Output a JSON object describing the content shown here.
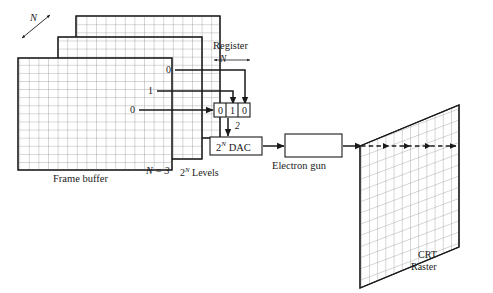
{
  "figure": {
    "background_color": "#ffffff",
    "line_color": "#1a1a1a",
    "grid_color": "#8c8c8c"
  },
  "frame_buffer": {
    "label": "Frame buffer",
    "depth_label": "N",
    "planes_label": "N = 3",
    "levels_label": "2",
    "levels_sup": "N",
    "levels_suffix": " Levels",
    "plane_count": 3,
    "grid_cols": 16,
    "grid_rows": 16,
    "pixel_bits": [
      {
        "plane": 1,
        "value": "0"
      },
      {
        "plane": 2,
        "value": "1"
      },
      {
        "plane": 3,
        "value": "0"
      }
    ]
  },
  "register": {
    "label": "Register",
    "width_label": "N",
    "left_arrow": "←",
    "right_arrow": "→",
    "cells": [
      "0",
      "1",
      "0"
    ]
  },
  "dac": {
    "label_base": "2",
    "label_sup": "N",
    "label_suffix": " DAC",
    "input_label": "2"
  },
  "electron_gun": {
    "label": "Electron gun"
  },
  "crt": {
    "label_line1": "CRT",
    "label_line2": "Raster",
    "grid_cols": 13,
    "grid_rows": 14,
    "scan_line": "dashed-beam"
  }
}
